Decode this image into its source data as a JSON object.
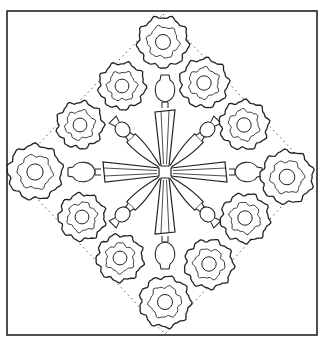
{
  "figure": {
    "colors": {
      "background": "#ffffff",
      "line": "#222222",
      "dotted": "#444444"
    },
    "frame": {
      "x": 7,
      "y": 11,
      "width": 310,
      "height": 324
    },
    "diamond": {
      "points": [
        [
          163,
          14
        ],
        [
          313,
          172
        ],
        [
          165,
          334
        ],
        [
          12,
          172
        ]
      ]
    },
    "center": [
      165,
      172
    ],
    "rosettes": [
      {
        "name": "top",
        "cx": 163,
        "cy": 42,
        "r": 25
      },
      {
        "name": "upper-left-inner",
        "cx": 122,
        "cy": 86,
        "r": 23
      },
      {
        "name": "upper-left-outer",
        "cx": 80,
        "cy": 125,
        "r": 23
      },
      {
        "name": "upper-right-inner",
        "cx": 204,
        "cy": 83,
        "r": 24
      },
      {
        "name": "upper-right-outer",
        "cx": 244,
        "cy": 125,
        "r": 24
      },
      {
        "name": "left",
        "cx": 35,
        "cy": 172,
        "r": 27
      },
      {
        "name": "right",
        "cx": 287,
        "cy": 177,
        "r": 26
      },
      {
        "name": "lower-left-inner",
        "cx": 82,
        "cy": 217,
        "r": 23
      },
      {
        "name": "lower-left-outer",
        "cx": 120,
        "cy": 258,
        "r": 23
      },
      {
        "name": "lower-right-inner",
        "cx": 245,
        "cy": 218,
        "r": 24
      },
      {
        "name": "lower-right-outer",
        "cx": 209,
        "cy": 264,
        "r": 24
      },
      {
        "name": "bottom",
        "cx": 165,
        "cy": 302,
        "r": 25
      }
    ]
  }
}
